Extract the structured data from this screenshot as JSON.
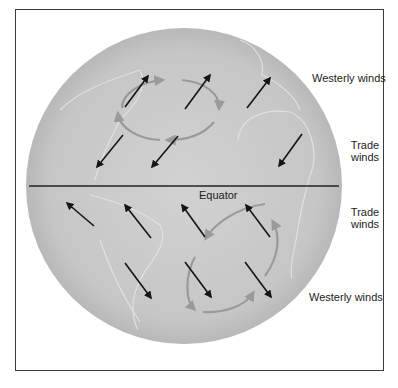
{
  "figure": {
    "type": "diagram",
    "colors": {
      "frame": "#3a3a3a",
      "globe_fill": "#c9c9c9",
      "globe_edge": "#b5b5b5",
      "continent_outline": "#e4e4e4",
      "wind_arrow": "#151515",
      "circulation_loop": "#9a9a9a",
      "equator_line": "#222222",
      "text": "#1c1c1c"
    }
  },
  "labels": {
    "westerly_north": "Westerly winds",
    "trade_north_line1": "Trade",
    "trade_north_line2": "winds",
    "equator": "Equator",
    "trade_south_line1": "Trade",
    "trade_south_line2": "winds",
    "westerly_south": "Westerly winds"
  },
  "globe": {
    "cx": 184,
    "cy": 186,
    "r": 158
  },
  "equator_line": {
    "x1": 29,
    "y1": 186,
    "x2": 339,
    "y2": 186
  },
  "wind_arrows": {
    "northern_westerlies": [
      {
        "x1": 125,
        "y1": 107,
        "x2": 148,
        "y2": 76
      },
      {
        "x1": 185,
        "y1": 109,
        "x2": 210,
        "y2": 75
      },
      {
        "x1": 247,
        "y1": 108,
        "x2": 270,
        "y2": 78
      }
    ],
    "northern_trades": [
      {
        "x1": 123,
        "y1": 135,
        "x2": 97,
        "y2": 167
      },
      {
        "x1": 178,
        "y1": 136,
        "x2": 152,
        "y2": 167
      },
      {
        "x1": 302,
        "y1": 134,
        "x2": 279,
        "y2": 166
      }
    ],
    "southern_trades": [
      {
        "x1": 94,
        "y1": 226,
        "x2": 67,
        "y2": 203
      },
      {
        "x1": 151,
        "y1": 238,
        "x2": 125,
        "y2": 205
      },
      {
        "x1": 205,
        "y1": 237,
        "x2": 182,
        "y2": 205
      },
      {
        "x1": 270,
        "y1": 237,
        "x2": 246,
        "y2": 205
      }
    ],
    "southern_westerlies": [
      {
        "x1": 125,
        "y1": 263,
        "x2": 151,
        "y2": 298
      },
      {
        "x1": 185,
        "y1": 262,
        "x2": 211,
        "y2": 297
      },
      {
        "x1": 245,
        "y1": 262,
        "x2": 271,
        "y2": 297
      }
    ]
  },
  "circulation_loops": [
    {
      "hemisphere": "north",
      "direction": "clockwise",
      "cx": 168,
      "cy": 110,
      "rx": 50,
      "ry": 30,
      "rotate": 0
    },
    {
      "hemisphere": "south",
      "direction": "counterclockwise",
      "cx": 233,
      "cy": 262,
      "rx": 58,
      "ry": 36,
      "rotate": -50
    }
  ]
}
